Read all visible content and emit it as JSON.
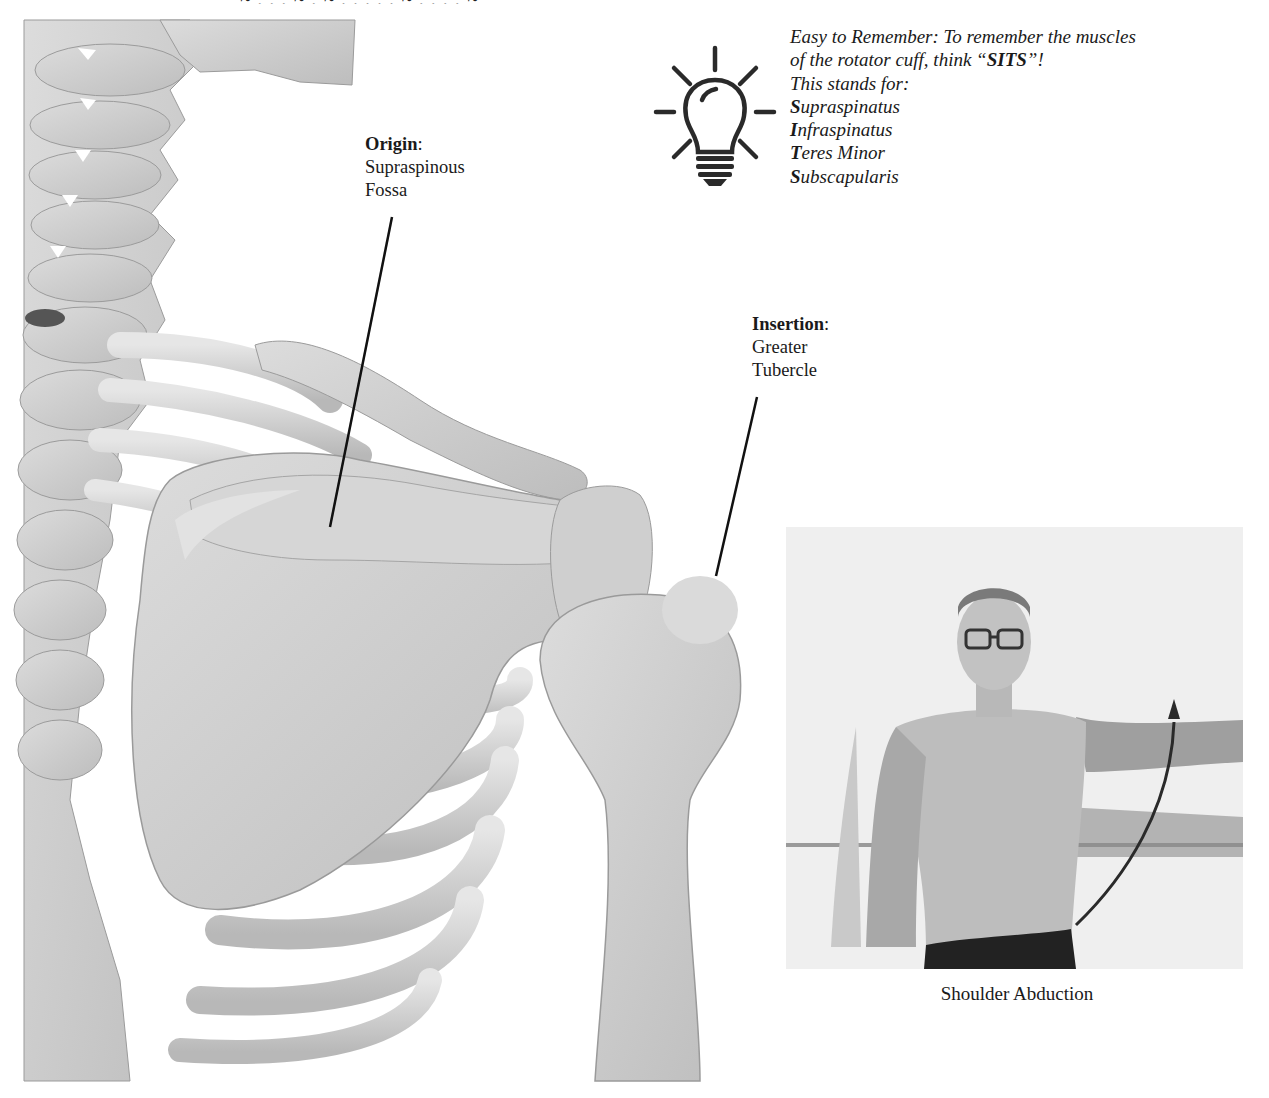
{
  "page": {
    "top_cut_text": "~ . . . ~ . ~ . . . . . ~ . . . . ~"
  },
  "labels": {
    "origin": {
      "title": "Origin",
      "colon": ":",
      "lines": [
        "Supraspinous",
        "Fossa"
      ]
    },
    "insertion": {
      "title": "Insertion",
      "colon": ":",
      "lines": [
        "Greater",
        "Tubercle"
      ]
    }
  },
  "tip": {
    "icon": "lightbulb-icon",
    "line1": "Easy to Remember: To remember the muscles",
    "line2_prefix": "of the rotator cuff, think “",
    "line2_bold": "SITS",
    "line2_suffix": "”!",
    "line3": "This stands for:",
    "muscles": [
      {
        "initial": "S",
        "rest": "upraspinatus"
      },
      {
        "initial": "I",
        "rest": "nfraspinatus"
      },
      {
        "initial": "T",
        "rest": "eres Minor"
      },
      {
        "initial": "S",
        "rest": "ubscapularis"
      }
    ]
  },
  "figure": {
    "skeleton_alt": "Posterior view of shoulder skeleton: scapula, clavicle, humerus, ribs and spine",
    "photo_alt": "Man demonstrating shoulder abduction with arrow showing arm raised sideways",
    "caption": "Shoulder Abduction"
  },
  "colors": {
    "text": "#1a1a1a",
    "bone": "#d2d2d2",
    "bone_shadow": "#a9a9a9",
    "pointer_line": "#111111"
  }
}
